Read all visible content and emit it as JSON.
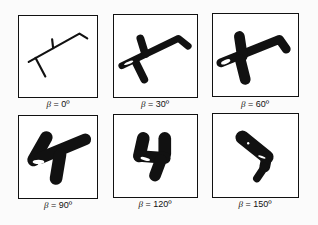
{
  "figure": {
    "panels": [
      {
        "symbol": "β",
        "equals": "=",
        "value": "0º",
        "shape": "thin-stick-figure"
      },
      {
        "symbol": "β",
        "equals": "=",
        "value": "30º",
        "shape": "thick-stick-figure"
      },
      {
        "symbol": "β",
        "equals": "=",
        "value": "60º",
        "shape": "thicker-stick-figure"
      },
      {
        "symbol": "β",
        "equals": "=",
        "value": "90º",
        "shape": "blob-figure"
      },
      {
        "symbol": "β",
        "equals": "=",
        "value": "120º",
        "shape": "compact-blob"
      },
      {
        "symbol": "β",
        "equals": "=",
        "value": "150º",
        "shape": "tilted-blob"
      }
    ]
  }
}
